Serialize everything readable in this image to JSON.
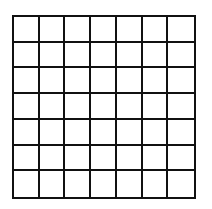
{
  "diagram": {
    "type": "square-grid",
    "rows": 7,
    "columns": 7,
    "line_color": "#111111",
    "cell_fill": "#ffffff",
    "background": "#ffffff"
  }
}
